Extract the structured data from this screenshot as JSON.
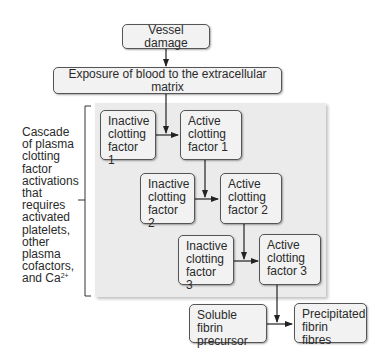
{
  "diagram": {
    "nodes": {
      "vessel_damage": "Vessel damage",
      "exposure": "Exposure of blood to the extracellular matrix",
      "inactive_1": [
        "Inactive",
        "clotting",
        "factor 1"
      ],
      "active_1": [
        "Active",
        "clotting",
        "factor 1"
      ],
      "inactive_2": [
        "Inactive",
        "clotting",
        "factor 2"
      ],
      "active_2": [
        "Active",
        "clotting",
        "factor 2"
      ],
      "inactive_3": [
        "Inactive",
        "clotting",
        "factor 3"
      ],
      "active_3": [
        "Active",
        "clotting",
        "factor 3"
      ],
      "soluble_fibrin": [
        "Soluble fibrin",
        "precursor"
      ],
      "precipitated_fibrin": [
        "Precipitated",
        "fibrin fibres"
      ]
    },
    "side_label": {
      "lines": [
        "Cascade",
        "of plasma",
        "clotting",
        "factor",
        "activations",
        "that",
        "requires",
        "activated",
        "platelets,",
        "other",
        "plasma",
        "cofactors,",
        "and Ca"
      ],
      "superscript": "2+"
    },
    "edges": [
      [
        "vessel_damage",
        "exposure"
      ],
      [
        "exposure",
        "inactive_1->active_1"
      ],
      [
        "inactive_1",
        "active_1"
      ],
      [
        "active_1",
        "inactive_2->active_2"
      ],
      [
        "inactive_2",
        "active_2"
      ],
      [
        "active_2",
        "inactive_3->active_3"
      ],
      [
        "inactive_3",
        "active_3"
      ],
      [
        "active_3",
        "soluble_fibrin->precipitated_fibrin"
      ],
      [
        "soluble_fibrin",
        "precipitated_fibrin"
      ]
    ],
    "colors": {
      "panel": "#ebebeb",
      "box_fill": "#f2f2f2",
      "border": "#555555",
      "text": "#2a2a2a"
    }
  }
}
